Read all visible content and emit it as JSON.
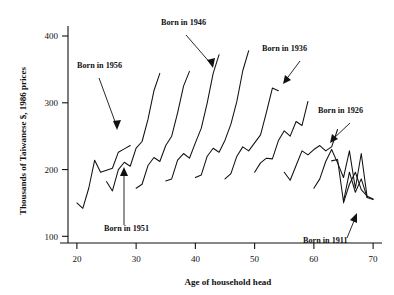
{
  "chart_data": {
    "type": "line",
    "title": "",
    "xlabel": "Age of household head",
    "ylabel": "Thousands of Taiwanese $, 1986 prices",
    "xlim": [
      18.5,
      71.5
    ],
    "ylim": [
      90,
      415
    ],
    "xticks": [
      20,
      30,
      40,
      50,
      60,
      70
    ],
    "xticklabels": [
      "20",
      "30",
      "40",
      "50",
      "60",
      "70"
    ],
    "yticks": [
      100,
      200,
      300,
      400
    ],
    "yticklabels": [
      "100",
      "200",
      "300",
      "400"
    ],
    "grid": false,
    "legend": "none",
    "xaxis_label_text": "Age of household head",
    "yaxis_label_text": "Thousands of Taiwanese $, 1986 prices",
    "series": [
      {
        "name": "Born in 1966",
        "x": [
          20,
          21,
          22,
          23,
          24,
          25,
          26,
          27,
          28,
          29
        ],
        "values": [
          150,
          142,
          172,
          214,
          196,
          199,
          202,
          226,
          231,
          236
        ]
      },
      {
        "name": "Born in 1961",
        "x": [
          25,
          26,
          27,
          28,
          29,
          30,
          31,
          32,
          33,
          34
        ],
        "values": [
          182,
          168,
          200,
          211,
          205,
          232,
          242,
          275,
          318,
          344
        ]
      },
      {
        "name": "Born in 1956",
        "x": [
          30,
          31,
          32,
          33,
          34,
          35,
          36,
          37,
          38,
          39
        ],
        "values": [
          172,
          178,
          206,
          218,
          212,
          236,
          250,
          285,
          325,
          347
        ]
      },
      {
        "name": "Born in 1951",
        "x": [
          35,
          36,
          37,
          38,
          39,
          40,
          41,
          42,
          43,
          44
        ],
        "values": [
          183,
          186,
          214,
          224,
          217,
          240,
          262,
          300,
          344,
          372
        ]
      },
      {
        "name": "Born in 1946",
        "x": [
          40,
          41,
          42,
          43,
          44,
          45,
          46,
          47,
          48,
          49
        ],
        "values": [
          188,
          192,
          220,
          232,
          226,
          244,
          268,
          302,
          348,
          378
        ]
      },
      {
        "name": "Born in 1941",
        "x": [
          45,
          46,
          47,
          48,
          49,
          50,
          51,
          52,
          53,
          54
        ],
        "values": [
          186,
          194,
          220,
          234,
          228,
          240,
          252,
          286,
          322,
          318
        ]
      },
      {
        "name": "Born in 1936",
        "x": [
          50,
          51,
          52,
          53,
          54,
          55,
          56,
          57,
          58,
          59
        ],
        "values": [
          196,
          210,
          217,
          216,
          243,
          258,
          250,
          272,
          266,
          302
        ]
      },
      {
        "name": "Born in 1931",
        "x": [
          55,
          56,
          57,
          58,
          59,
          60,
          61,
          62,
          63,
          64
        ],
        "values": [
          196,
          184,
          206,
          228,
          222,
          230,
          236,
          228,
          234,
          260
        ]
      },
      {
        "name": "Born in 1926",
        "x": [
          60,
          61,
          62,
          63,
          64,
          65,
          66,
          67,
          68,
          69
        ],
        "values": [
          172,
          186,
          212,
          230,
          210,
          188,
          228,
          172,
          224,
          158
        ]
      },
      {
        "name": "Born in 1921",
        "x": [
          63,
          64,
          65,
          66,
          67,
          68,
          69,
          70
        ],
        "values": [
          213,
          215,
          152,
          196,
          166,
          186,
          158,
          155
        ]
      },
      {
        "name": "Born in 1911",
        "x": [
          65,
          66,
          67,
          68,
          69,
          70
        ],
        "values": [
          150,
          178,
          196,
          170,
          160,
          156
        ]
      }
    ],
    "annotations": [
      {
        "label": "Born in 1956",
        "text_x": 77,
        "text_y": 68
      },
      {
        "label": "Born in 1946",
        "text_x": 161,
        "text_y": 25
      },
      {
        "label": "Born in 1936",
        "text_x": 262,
        "text_y": 51
      },
      {
        "label": "Born in 1926",
        "text_x": 318,
        "text_y": 113
      },
      {
        "label": "Born in 1951",
        "text_x": 104,
        "text_y": 231
      },
      {
        "label": "Born in 1911",
        "text_x": 303,
        "text_y": 243
      }
    ]
  }
}
